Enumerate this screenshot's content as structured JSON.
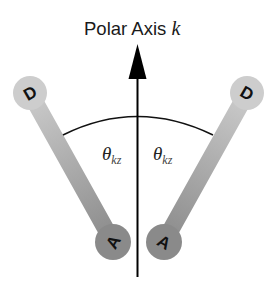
{
  "title": {
    "text": "Polar Axis ",
    "variable": "k"
  },
  "angle_labels": [
    {
      "symbol": "θ",
      "subscript": "kz"
    },
    {
      "symbol": "θ",
      "subscript": "kz"
    }
  ],
  "dipoles": [
    {
      "side": "left",
      "donor_label": "D",
      "acceptor_label": "A"
    },
    {
      "side": "right",
      "donor_label": "D",
      "acceptor_label": "A"
    }
  ],
  "colors": {
    "donor_fill": "#c8c8c8",
    "acceptor_fill": "#8a8a8a",
    "axis": "#000000",
    "arc": "#111111"
  }
}
